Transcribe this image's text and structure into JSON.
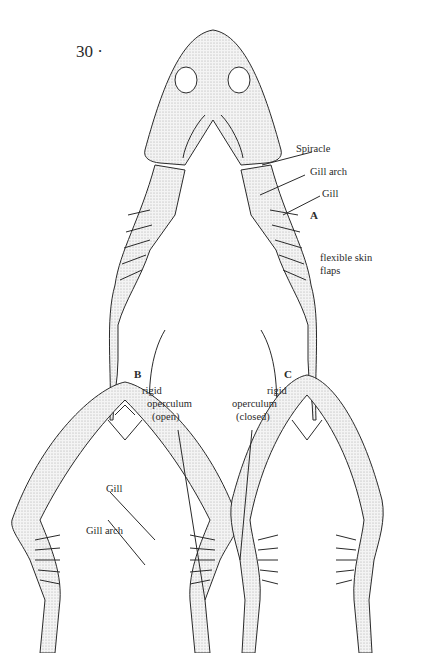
{
  "page": {
    "number": "30 ·"
  },
  "panels": {
    "A": {
      "letter": "A",
      "labels": {
        "spiracle": "Spiracle",
        "gill_arch": "Gill arch",
        "gill": "Gill",
        "flaps_line1": "flexible skin",
        "flaps_line2": "flaps"
      }
    },
    "B": {
      "letter": "B",
      "labels": {
        "operculum_line1": "rigid",
        "operculum_line2": "operculum",
        "operculum_line3": "(open)",
        "gill": "Gill",
        "gill_arch": "Gill arch"
      }
    },
    "C": {
      "letter": "C",
      "labels": {
        "operculum_line1": "rigid",
        "operculum_line2": "operculum",
        "operculum_line3": "(closed)"
      }
    }
  },
  "colors": {
    "ink": "#2a2a2a",
    "stipple": "#e6e6e6",
    "background": "#ffffff"
  }
}
